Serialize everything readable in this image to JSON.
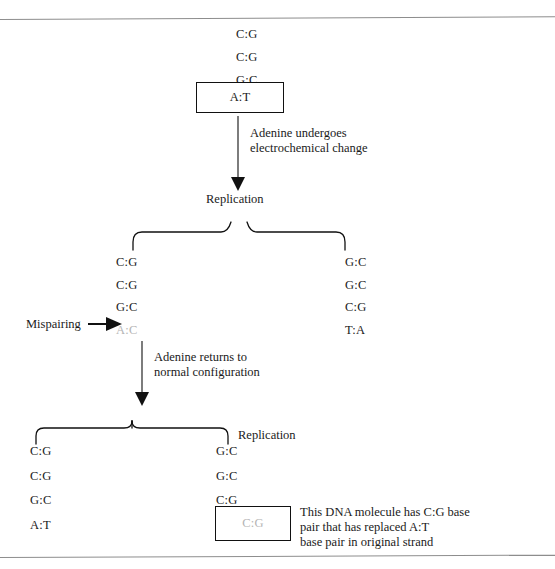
{
  "figure": {
    "type": "biology-process-diagram",
    "topic": "Tautomeric shift of adenine causing a base-pair substitution mutation during DNA replication"
  },
  "top_strand": {
    "pairs": [
      "C:G",
      "C:G",
      "G:C"
    ],
    "boxed_pair": {
      "highlight_letter": "A",
      "rest": ":T",
      "full": "A:T"
    }
  },
  "step1": {
    "caption_line1": "Adenine undergoes",
    "caption_line2": "electrochemical change",
    "arrow": "down-arrow"
  },
  "replication1": {
    "label": "Replication"
  },
  "daughter_left": {
    "pairs": [
      "C:G",
      "C:G",
      "G:C"
    ],
    "mismatch": "A:C"
  },
  "daughter_right": {
    "pairs": [
      "G:C",
      "G:C",
      "C:G",
      "T:A"
    ]
  },
  "mispairing": {
    "label": "Mispairing",
    "arrow": "right-arrow"
  },
  "step2": {
    "caption_line1": "Adenine returns to",
    "caption_line2": "normal configuration",
    "arrow": "down-arrow"
  },
  "replication2": {
    "label": "Replication"
  },
  "final_left": {
    "pairs": [
      "C:G",
      "C:G",
      "G:C",
      "A:T"
    ]
  },
  "final_right": {
    "pairs": [
      "G:C",
      "G:C",
      "C:G"
    ],
    "boxed_pair": "C:G"
  },
  "annotation": {
    "line1": "This DNA molecule has C:G base",
    "line2": "pair that has replaced A:T",
    "line3": "base pair in original strand"
  },
  "colors": {
    "text": "#1a1a1a",
    "faded_text": "#b4b4b4",
    "rule": "#8d8d8d",
    "stroke": "#111111",
    "background": "#ffffff"
  }
}
